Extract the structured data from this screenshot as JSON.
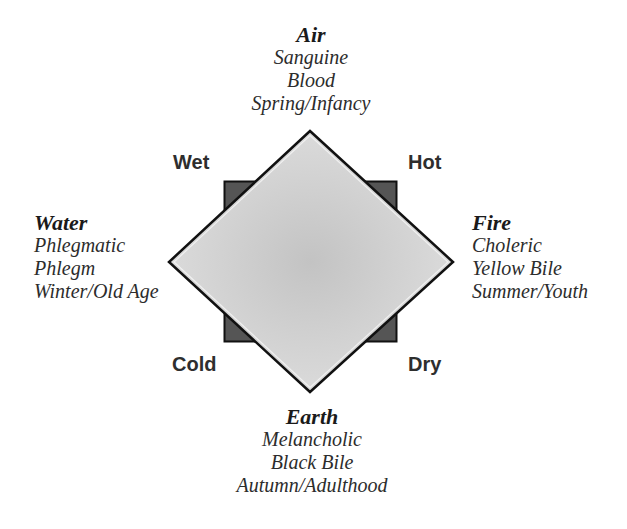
{
  "diagram": {
    "elements": {
      "air": {
        "name": "Air",
        "temperament": "Sanguine",
        "humor": "Blood",
        "season_age": "Spring/Infancy"
      },
      "water": {
        "name": "Water",
        "temperament": "Phlegmatic",
        "humor": "Phlegm",
        "season_age": "Winter/Old Age"
      },
      "fire": {
        "name": "Fire",
        "temperament": "Choleric",
        "humor": "Yellow Bile",
        "season_age": "Summer/Youth"
      },
      "earth": {
        "name": "Earth",
        "temperament": "Melancholic",
        "humor": "Black Bile",
        "season_age": "Autumn/Adulthood"
      }
    },
    "qualities": {
      "wet": "Wet",
      "hot": "Hot",
      "cold": "Cold",
      "dry": "Dry"
    },
    "colors": {
      "diamond_center": "#c3c3c3",
      "diamond_edge": "#dcdcdc",
      "diamond_stroke": "#111111",
      "square_fill": "#555555",
      "square_stroke": "#111111",
      "text": "#2c2c2c"
    }
  }
}
